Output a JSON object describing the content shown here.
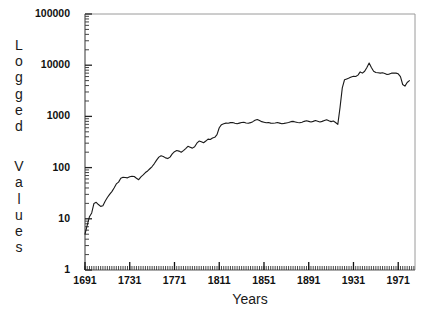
{
  "chart_data": {
    "type": "line",
    "title": "",
    "xlabel": "Years",
    "ylabel": "Logged Values",
    "ylabel_letters": [
      "L",
      "o",
      "g",
      "g",
      "e",
      "d",
      " ",
      "V",
      "a",
      "l",
      "u",
      "e",
      "s"
    ],
    "yscale": "log",
    "ylim": [
      1,
      100000
    ],
    "xlim": [
      1691,
      1986
    ],
    "grid": false,
    "legend": null,
    "line_color": "#1a1a1a",
    "axis_color": "#555555",
    "background_color": "#ffffff",
    "ytick_labels": [
      "1",
      "10",
      "100",
      "1000",
      "10000",
      "100000"
    ],
    "ytick_values": [
      1,
      10,
      100,
      1000,
      10000,
      100000
    ],
    "xtick_labels": [
      "1691",
      "1731",
      "1771",
      "1811",
      "1851",
      "1891",
      "1931",
      "1971"
    ],
    "xtick_values": [
      1691,
      1731,
      1771,
      1811,
      1851,
      1891,
      1931,
      1971
    ],
    "x": [
      1691,
      1693,
      1695,
      1697,
      1699,
      1701,
      1703,
      1705,
      1707,
      1709,
      1711,
      1713,
      1715,
      1717,
      1719,
      1721,
      1723,
      1725,
      1727,
      1729,
      1731,
      1733,
      1735,
      1737,
      1739,
      1741,
      1743,
      1745,
      1747,
      1749,
      1751,
      1753,
      1755,
      1757,
      1759,
      1761,
      1763,
      1765,
      1767,
      1769,
      1771,
      1773,
      1775,
      1777,
      1779,
      1781,
      1783,
      1785,
      1787,
      1789,
      1791,
      1793,
      1795,
      1797,
      1799,
      1801,
      1803,
      1805,
      1807,
      1809,
      1811,
      1813,
      1815,
      1817,
      1819,
      1821,
      1823,
      1825,
      1827,
      1829,
      1831,
      1833,
      1835,
      1837,
      1839,
      1841,
      1843,
      1845,
      1847,
      1849,
      1851,
      1853,
      1855,
      1857,
      1859,
      1861,
      1863,
      1865,
      1867,
      1869,
      1871,
      1873,
      1875,
      1877,
      1879,
      1881,
      1883,
      1885,
      1887,
      1889,
      1891,
      1893,
      1895,
      1897,
      1899,
      1901,
      1903,
      1905,
      1907,
      1909,
      1911,
      1913,
      1915,
      1917,
      1919,
      1921,
      1923,
      1925,
      1927,
      1929,
      1931,
      1933,
      1935,
      1937,
      1939,
      1941,
      1943,
      1945,
      1947,
      1949,
      1951,
      1953,
      1955,
      1957,
      1959,
      1961,
      1963,
      1965,
      1967,
      1969,
      1971,
      1973,
      1975,
      1977,
      1979,
      1981
    ],
    "y": [
      5,
      7.5,
      11,
      13,
      20,
      21,
      19,
      17.5,
      18,
      22,
      26,
      30,
      34,
      40,
      48,
      52,
      62,
      65,
      64,
      63,
      66,
      68,
      67,
      62,
      58,
      66,
      72,
      80,
      86,
      95,
      105,
      120,
      140,
      160,
      170,
      165,
      155,
      150,
      160,
      185,
      205,
      215,
      210,
      200,
      215,
      235,
      260,
      250,
      240,
      255,
      300,
      330,
      320,
      305,
      330,
      360,
      355,
      380,
      390,
      440,
      600,
      690,
      720,
      740,
      735,
      755,
      760,
      735,
      720,
      740,
      760,
      770,
      745,
      735,
      755,
      790,
      840,
      870,
      830,
      790,
      770,
      750,
      760,
      740,
      735,
      745,
      760,
      740,
      720,
      730,
      745,
      760,
      790,
      800,
      780,
      760,
      750,
      770,
      800,
      820,
      800,
      780,
      800,
      830,
      805,
      780,
      800,
      830,
      860,
      820,
      790,
      810,
      760,
      700,
      1500,
      3600,
      5200,
      5400,
      5600,
      5900,
      6100,
      6000,
      6400,
      7400,
      7000,
      7600,
      9000,
      11000,
      9000,
      7600,
      7200,
      7100,
      7000,
      7100,
      6900,
      6600,
      6700,
      7000,
      7050,
      7000,
      6800,
      6000,
      4200,
      3900,
      4600,
      5000
    ]
  }
}
